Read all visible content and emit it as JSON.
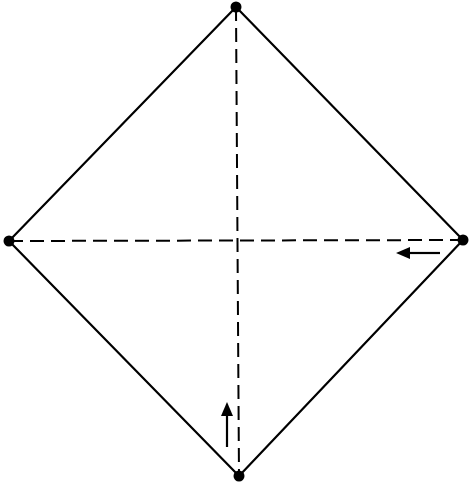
{
  "diagram": {
    "type": "origami-fold-diagram",
    "shape": "square-on-diagonal",
    "colors": {
      "line": "#000000",
      "background": "#ffffff"
    },
    "vertices": {
      "top": [
        236,
        7
      ],
      "right": [
        463,
        240
      ],
      "bottom": [
        239,
        476
      ],
      "left": [
        9,
        241
      ]
    },
    "fold_lines": [
      {
        "name": "vertical-valley-fold",
        "style": "dashed",
        "from": "top",
        "to": "bottom"
      },
      {
        "name": "horizontal-valley-fold",
        "style": "dashed",
        "from": "left",
        "to": "right"
      }
    ],
    "arrows": [
      {
        "name": "fold-arrow-left",
        "direction": "left",
        "x1": 440,
        "y1": 253,
        "x2": 398,
        "y2": 253
      },
      {
        "name": "fold-arrow-up",
        "direction": "up",
        "x1": 227,
        "y1": 447,
        "x2": 227,
        "y2": 403
      }
    ]
  }
}
